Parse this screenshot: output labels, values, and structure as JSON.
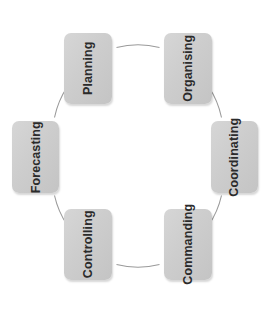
{
  "diagram": {
    "type": "cycle",
    "title": "",
    "shape": "circle",
    "connector_color": "#9a9a9a",
    "node_fill_color": "#cdcdcd",
    "node_text_color": "#2b2b2b",
    "background_color": "#ffffff",
    "text_orientation": "vertical-rotated-90",
    "circle": {
      "center_x": 134,
      "center_y": 156,
      "radius": 88
    },
    "nodes": [
      {
        "id": "planning",
        "label": "Planning",
        "position": "top-left",
        "angle_deg": 120
      },
      {
        "id": "organising",
        "label": "Organising",
        "position": "top-right",
        "angle_deg": 60
      },
      {
        "id": "coordinating",
        "label": "Coordinating",
        "position": "right",
        "angle_deg": 0
      },
      {
        "id": "commanding",
        "label": "Commanding",
        "position": "bottom-right",
        "angle_deg": 300
      },
      {
        "id": "controlling",
        "label": "Controlling",
        "position": "bottom-left",
        "angle_deg": 240
      },
      {
        "id": "forecasting",
        "label": "Forecasting",
        "position": "left",
        "angle_deg": 180
      }
    ],
    "arcs": [
      {
        "from": "planning",
        "to": "organising"
      },
      {
        "from": "organising",
        "to": "coordinating"
      },
      {
        "from": "coordinating",
        "to": "commanding"
      },
      {
        "from": "commanding",
        "to": "controlling"
      },
      {
        "from": "controlling",
        "to": "forecasting"
      },
      {
        "from": "forecasting",
        "to": "planning"
      }
    ]
  }
}
